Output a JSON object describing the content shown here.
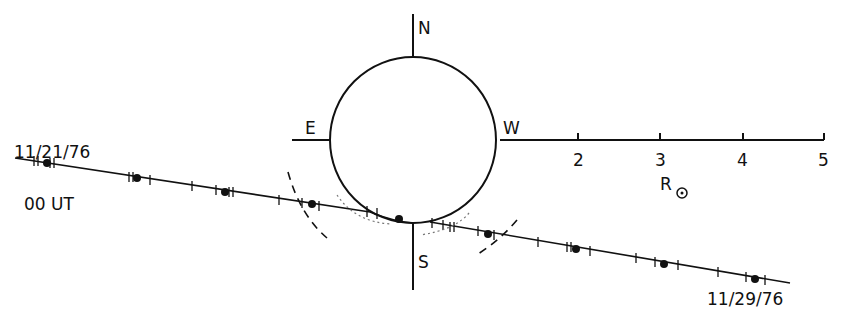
{
  "diagram": {
    "compass": {
      "north": "N",
      "south": "S",
      "east": "E",
      "west": "W"
    },
    "scale": {
      "ticks": [
        "2",
        "3",
        "4",
        "5"
      ],
      "unit_label": "R",
      "unit_symbol": "sun-symbol"
    },
    "path": {
      "start_label": "11/21/76",
      "time_label": "00 UT",
      "end_label": "11/29/76"
    }
  }
}
